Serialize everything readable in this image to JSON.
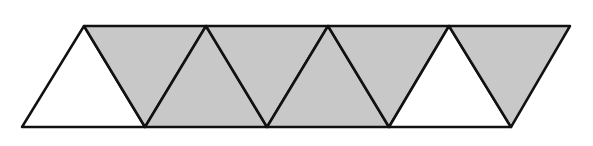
{
  "figure": {
    "fill_shaded": "#c8c8c8",
    "fill_unshaded": "#ffffff",
    "stroke": "#111111",
    "top_vertices_x": [
      84,
      206,
      328,
      449,
      570
    ],
    "bottom_vertices_x": [
      22,
      145,
      267,
      389,
      511
    ],
    "top_y": 26,
    "bottom_y": 127,
    "triangles": [
      {
        "index": 1,
        "orientation": "up",
        "shaded": false
      },
      {
        "index": 2,
        "orientation": "down",
        "shaded": true
      },
      {
        "index": 3,
        "orientation": "up",
        "shaded": true
      },
      {
        "index": 4,
        "orientation": "down",
        "shaded": true
      },
      {
        "index": 5,
        "orientation": "up",
        "shaded": true
      },
      {
        "index": 6,
        "orientation": "down",
        "shaded": true
      },
      {
        "index": 7,
        "orientation": "up",
        "shaded": false
      },
      {
        "index": 8,
        "orientation": "down",
        "shaded": true
      }
    ],
    "counts": {
      "total": 8,
      "shaded": 6,
      "unshaded": 2
    }
  }
}
